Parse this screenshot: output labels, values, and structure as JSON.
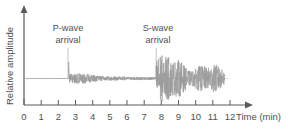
{
  "chart_data": {
    "type": "line",
    "title": "",
    "xlabel": "Time (min)",
    "ylabel": "Relative amplitude",
    "xlim": [
      0,
      12.8
    ],
    "ylim": [
      -1,
      1
    ],
    "grid": false,
    "legend": null,
    "xticklabels": [
      "0",
      "1",
      "2",
      "3",
      "4",
      "5",
      "6",
      "7",
      "8",
      "9",
      "10",
      "11",
      "12"
    ],
    "xticks": [
      0,
      1,
      2,
      3,
      4,
      5,
      6,
      7,
      8,
      9,
      10,
      11,
      12
    ],
    "yticklabels": [],
    "series": [
      {
        "name": "seismogram",
        "color": "#9a9a9a",
        "description": "Ground motion trace: quiet before P arrival, moderate P coda, large S coda decaying with time",
        "phases": [
          {
            "name": "pre-event noise",
            "t_start": 0.0,
            "t_end": 2.6,
            "amplitude": 0.01
          },
          {
            "name": "P-wave onset spike",
            "t_start": 2.6,
            "t_end": 2.65,
            "amplitude": 0.62
          },
          {
            "name": "P-wave coda",
            "t_start": 2.65,
            "t_end": 7.7,
            "amplitude": 0.13
          },
          {
            "name": "S-wave onset",
            "t_start": 7.7,
            "t_end": 8.2,
            "amplitude": 0.95
          },
          {
            "name": "S-wave coda",
            "t_start": 8.2,
            "t_end": 11.7,
            "amplitude": 0.55
          }
        ]
      }
    ],
    "annotations": [
      {
        "label_line1": "P-wave",
        "label_line2": "arrival",
        "t": 2.6,
        "leader": true
      },
      {
        "label_line1": "S-wave",
        "label_line2": "arrival",
        "t": 7.7,
        "leader": true
      }
    ]
  },
  "axes": {
    "x_title": "Time (min)",
    "y_title": "Relative amplitude",
    "x_arrow": "arrow-right-icon",
    "y_arrow": "arrow-up-icon",
    "axis_color": "#5a5a5a",
    "trace_color": "#9a9a9a",
    "leader_color": "#b4b4b4"
  },
  "annotations": {
    "p_wave": {
      "line1": "P-wave",
      "line2": "arrival"
    },
    "s_wave": {
      "line1": "S-wave",
      "line2": "arrival"
    }
  }
}
